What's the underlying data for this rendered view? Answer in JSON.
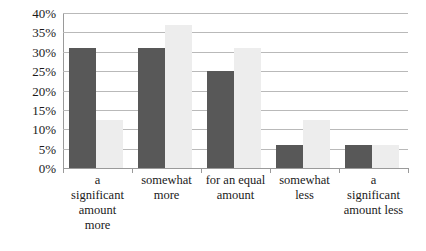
{
  "chart_data": {
    "type": "bar",
    "title": "",
    "subtitle": "",
    "xlabel": "",
    "ylabel": "",
    "ylim": [
      0,
      40
    ],
    "ytick_step": 5,
    "ytick_labels": [
      "40%",
      "35%",
      "30%",
      "25%",
      "20%",
      "15%",
      "10%",
      "5%",
      "0%"
    ],
    "ytick_values": [
      40,
      35,
      30,
      25,
      20,
      15,
      10,
      5,
      0
    ],
    "grid": true,
    "legend": "none",
    "categories": [
      "a significant amount more",
      "somewhat more",
      "for an equal amount",
      "somewhat less",
      "a significant amount less"
    ],
    "category_label_lines": [
      [
        "a",
        "significant",
        "amount",
        "more"
      ],
      [
        "somewhat",
        "more"
      ],
      [
        "for an equal",
        "amount"
      ],
      [
        "somewhat",
        "less"
      ],
      [
        "a",
        "significant",
        "amount less"
      ]
    ],
    "series": [
      {
        "name": "Series 1",
        "color": "#585858",
        "values": [
          31,
          31,
          25,
          6,
          6
        ]
      },
      {
        "name": "Series 2",
        "color": "#ededed",
        "values": [
          12.5,
          37,
          31,
          12.5,
          6
        ]
      }
    ]
  },
  "colors": {
    "series_a": "#585858",
    "series_b": "#ededed",
    "gridline": "#b9b9b9",
    "axis": "#9a9a9a",
    "text": "#1a1a1a",
    "background": "#ffffff"
  }
}
